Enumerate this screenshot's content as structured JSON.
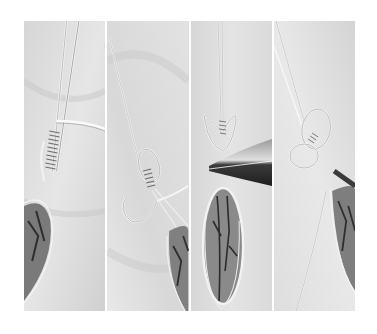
{
  "image": {
    "description": "Grayscale four-panel photo collage showing steps of wire-wrapping an oval marbled stone pendant on a crumpled cloth background",
    "palette": {
      "background": "#ffffff",
      "cloth_light": "#e4e4e4",
      "cloth_mid": "#cfcfcf",
      "wire": "#f4f4f4",
      "wire_edge": "#8a8a8a",
      "stone_mid": "#8c8c8c",
      "stone_dark": "#3a3a3a",
      "pliers": "#2a2a2a"
    },
    "panels": [
      {
        "step": 1,
        "content": "wire coil wrapped around base of wires, stone partially visible bottom-left"
      },
      {
        "step": 2,
        "content": "wire looped into heart shape with coil, stone at lower right"
      },
      {
        "step": 3,
        "content": "heart-shaped wire loops gripped by pliers, full oval stone below"
      },
      {
        "step": 4,
        "content": "finished heart bail loops with wire extending down, stone at right"
      }
    ]
  }
}
